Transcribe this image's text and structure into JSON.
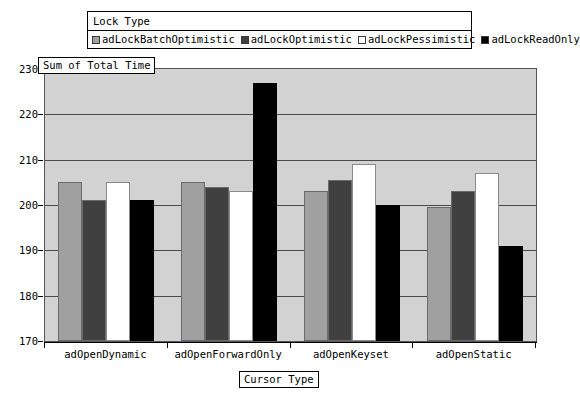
{
  "legend": {
    "title": "Lock Type",
    "items": [
      {
        "label": "adLockBatchOptimistic",
        "color": "#a0a0a0"
      },
      {
        "label": "adLockOptimistic",
        "color": "#404040"
      },
      {
        "label": "adLockPessimistic",
        "color": "#ffffff"
      },
      {
        "label": "adLockReadOnly",
        "color": "#000000"
      }
    ]
  },
  "axes": {
    "y_title": "Sum of Total Time",
    "x_title": "Cursor Type",
    "y_ticks": [
      "230",
      "220",
      "210",
      "200",
      "190",
      "180",
      "170"
    ]
  },
  "chart_data": {
    "type": "bar",
    "title": "",
    "xlabel": "Cursor Type",
    "ylabel": "Sum of Total Time",
    "ylim": [
      170,
      230
    ],
    "ytick_values": [
      170,
      180,
      190,
      200,
      210,
      220,
      230
    ],
    "grid": true,
    "legend_position": "top",
    "legend_title": "Lock Type",
    "categories": [
      "adOpenDynamic",
      "adOpenForwardOnly",
      "adOpenKeyset",
      "adOpenStatic"
    ],
    "series": [
      {
        "name": "adLockBatchOptimistic",
        "color": "#a0a0a0",
        "values": [
          205,
          205,
          203,
          199.5
        ]
      },
      {
        "name": "adLockOptimistic",
        "color": "#404040",
        "values": [
          201,
          204,
          205.5,
          203
        ]
      },
      {
        "name": "adLockPessimistic",
        "color": "#ffffff",
        "values": [
          205,
          203,
          209,
          207
        ]
      },
      {
        "name": "adLockReadOnly",
        "color": "#000000",
        "values": [
          201,
          227,
          200,
          191
        ]
      }
    ]
  }
}
